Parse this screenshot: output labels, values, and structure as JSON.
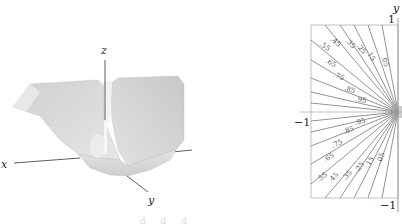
{
  "figure": {
    "surface_plot": {
      "axes": {
        "x": "x",
        "y": "y",
        "z": "z"
      },
      "description": "3D surface with V-shaped trough and narrow spike along z axis"
    },
    "contour_plot": {
      "axis_label_y": "y",
      "tick_top": "1",
      "tick_left": "−1",
      "tick_bottom": "−1",
      "levels_upper": [
        ".05",
        ".15",
        ".25",
        ".35",
        ".45",
        ".55",
        ".65",
        ".75",
        ".85",
        ".95"
      ],
      "levels_lower": [
        ".95",
        ".85",
        ".75",
        ".65",
        ".55",
        ".45",
        ".35",
        ".25",
        ".15",
        ".05"
      ]
    },
    "footer_fragment": "d  d  d"
  },
  "colors": {
    "surface": "#d9d9d9",
    "surface_shadow": "#bdbdbd",
    "contour_lines": "#777777",
    "axes": "#333333"
  }
}
